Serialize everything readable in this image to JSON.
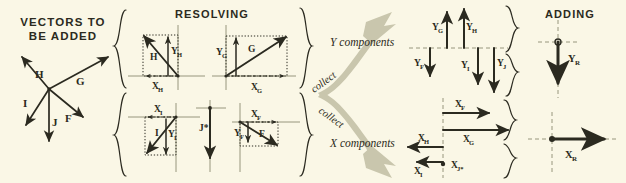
{
  "figure": {
    "background_color": "#faf7e6",
    "ink_color": "#2b2a20",
    "band_color": "#c9c6ad",
    "type": "diagram"
  },
  "panels": {
    "vectors_to_be_added": {
      "title_line1": "VECTORS TO",
      "title_line2": "BE ADDED",
      "vectors": [
        {
          "name": "H",
          "label": "H",
          "dir": "up-left"
        },
        {
          "name": "G",
          "label": "G",
          "dir": "up-right"
        },
        {
          "name": "I",
          "label": "I",
          "dir": "down-left"
        },
        {
          "name": "J",
          "label": "J",
          "dir": "down"
        },
        {
          "name": "F",
          "label": "F",
          "dir": "down-right"
        }
      ]
    },
    "resolving": {
      "title": "RESOLVING",
      "boxes": [
        {
          "vector": "H",
          "x_label": "X",
          "x_sub": "H",
          "y_label": "Y",
          "y_sub": "H",
          "x_sign": "negative",
          "y_sign": "positive"
        },
        {
          "vector": "G",
          "x_label": "X",
          "x_sub": "G",
          "y_label": "Y",
          "y_sub": "G",
          "x_sign": "positive",
          "y_sign": "positive"
        },
        {
          "vector": "I",
          "x_label": "X",
          "x_sub": "I",
          "y_label": "Y",
          "y_sub": "I",
          "x_sign": "negative",
          "y_sign": "negative"
        },
        {
          "vector": "J",
          "x_label": "",
          "x_sub": "",
          "y_label": "",
          "y_sub": "",
          "note": "J*",
          "x_sign": "zero",
          "y_sign": "negative"
        },
        {
          "vector": "F",
          "x_label": "X",
          "x_sub": "F",
          "y_label": "Y",
          "y_sub": "F",
          "x_sign": "positive",
          "y_sign": "negative"
        }
      ]
    },
    "collect": {
      "label_top": "collect",
      "label_bottom": "collect",
      "y_components_title": "Y components",
      "x_components_title": "X components"
    },
    "components": {
      "y_group": [
        {
          "label": "Y",
          "sub": "G",
          "dir": "up"
        },
        {
          "label": "Y",
          "sub": "H",
          "dir": "up"
        },
        {
          "label": "Y",
          "sub": "F",
          "dir": "down"
        },
        {
          "label": "Y",
          "sub": "I",
          "dir": "down"
        },
        {
          "label": "Y",
          "sub": "J",
          "dir": "down"
        }
      ],
      "x_group": [
        {
          "label": "X",
          "sub": "F",
          "dir": "right"
        },
        {
          "label": "X",
          "sub": "G",
          "dir": "right"
        },
        {
          "label": "X",
          "sub": "H",
          "dir": "left"
        },
        {
          "label": "X",
          "sub": "I",
          "dir": "left"
        },
        {
          "label": "X",
          "sub": "J*",
          "dir": "zero"
        }
      ]
    },
    "adding": {
      "title": "ADDING",
      "results": [
        {
          "label": "Y",
          "sub": "R",
          "dir": "down"
        },
        {
          "label": "X",
          "sub": "R",
          "dir": "right"
        }
      ]
    }
  }
}
